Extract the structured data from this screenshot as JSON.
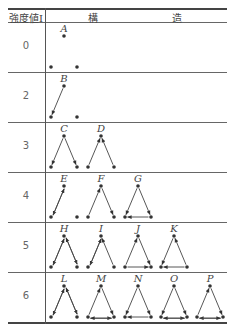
{
  "table": {
    "header": {
      "intensity_label": "強度値I",
      "structure_label_1": "構",
      "structure_label_2": "造"
    },
    "rows": [
      {
        "intensity": "0",
        "structures": [
          {
            "label": "A",
            "edges": []
          }
        ]
      },
      {
        "intensity": "2",
        "structures": [
          {
            "label": "B",
            "edges": [
              [
                "top",
                "left"
              ]
            ]
          }
        ]
      },
      {
        "intensity": "3",
        "structures": [
          {
            "label": "C",
            "edges": [
              [
                "top",
                "left"
              ],
              [
                "top",
                "right"
              ]
            ]
          },
          {
            "label": "D",
            "edges": [
              [
                "left",
                "top"
              ],
              [
                "right",
                "top"
              ]
            ]
          }
        ]
      },
      {
        "intensity": "4",
        "structures": [
          {
            "label": "E",
            "edges": [
              [
                "top",
                "left"
              ],
              [
                "left",
                "top"
              ]
            ]
          },
          {
            "label": "F",
            "edges": [
              [
                "left",
                "top"
              ],
              [
                "top",
                "right"
              ]
            ]
          },
          {
            "label": "G",
            "edges": [
              [
                "top",
                "left"
              ],
              [
                "top",
                "right"
              ],
              [
                "right",
                "left"
              ]
            ]
          }
        ]
      },
      {
        "intensity": "5",
        "structures": [
          {
            "label": "H",
            "edges": [
              [
                "top",
                "left"
              ],
              [
                "top",
                "right"
              ],
              [
                "left",
                "top"
              ],
              [
                "right",
                "top"
              ]
            ]
          },
          {
            "label": "I",
            "edges": [
              [
                "top",
                "left"
              ],
              [
                "right",
                "top"
              ],
              [
                "left",
                "top"
              ]
            ]
          },
          {
            "label": "J",
            "edges": [
              [
                "left",
                "top"
              ],
              [
                "top",
                "right"
              ],
              [
                "left",
                "right"
              ]
            ]
          },
          {
            "label": "K",
            "edges": [
              [
                "top",
                "left"
              ],
              [
                "right",
                "top"
              ],
              [
                "right",
                "left"
              ]
            ]
          }
        ]
      },
      {
        "intensity": "6",
        "structures": [
          {
            "label": "L",
            "edges": [
              [
                "top",
                "left"
              ],
              [
                "top",
                "right"
              ],
              [
                "left",
                "top"
              ],
              [
                "right",
                "top"
              ]
            ]
          },
          {
            "label": "M",
            "edges": [
              [
                "left",
                "top"
              ],
              [
                "top",
                "right"
              ],
              [
                "left",
                "right"
              ],
              [
                "right",
                "left"
              ]
            ]
          },
          {
            "label": "N",
            "edges": [
              [
                "top",
                "left"
              ],
              [
                "top",
                "right"
              ],
              [
                "right",
                "left"
              ]
            ]
          },
          {
            "label": "O",
            "edges": [
              [
                "top",
                "left"
              ],
              [
                "top",
                "right"
              ],
              [
                "left",
                "right"
              ],
              [
                "right",
                "left"
              ]
            ]
          },
          {
            "label": "P",
            "edges": [
              [
                "left",
                "top"
              ],
              [
                "top",
                "right"
              ],
              [
                "right",
                "left"
              ],
              [
                "left",
                "right"
              ]
            ]
          }
        ]
      }
    ]
  }
}
